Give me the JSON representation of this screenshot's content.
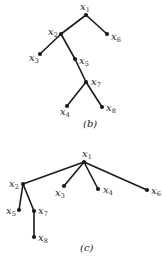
{
  "diagrams": [
    {
      "id": "b",
      "caption": "(b)",
      "caption_pos": [
        83,
        127
      ],
      "nodes": [
        {
          "id": "x1",
          "var": "x",
          "sub": "1",
          "pos": [
            86,
            15
          ],
          "label_pos": [
            80,
            10
          ]
        },
        {
          "id": "x2",
          "var": "x",
          "sub": "2",
          "pos": [
            61,
            34
          ],
          "label_pos": [
            48,
            35
          ]
        },
        {
          "id": "x3",
          "var": "x",
          "sub": "3",
          "pos": [
            40,
            54
          ],
          "label_pos": [
            29,
            61
          ]
        },
        {
          "id": "x4",
          "var": "x",
          "sub": "4",
          "pos": [
            67,
            106
          ],
          "label_pos": [
            60,
            115
          ]
        },
        {
          "id": "x5",
          "var": "x",
          "sub": "5",
          "pos": [
            75,
            59
          ],
          "label_pos": [
            79,
            64
          ]
        },
        {
          "id": "x6",
          "var": "x",
          "sub": "6",
          "pos": [
            107,
            34
          ],
          "label_pos": [
            111,
            40
          ]
        },
        {
          "id": "x7",
          "var": "x",
          "sub": "7",
          "pos": [
            86,
            82
          ],
          "label_pos": [
            91,
            85
          ]
        },
        {
          "id": "x8",
          "var": "x",
          "sub": "8",
          "pos": [
            102,
            107
          ],
          "label_pos": [
            106,
            111
          ]
        }
      ],
      "edges": [
        [
          "x1",
          "x2"
        ],
        [
          "x1",
          "x6"
        ],
        [
          "x2",
          "x3"
        ],
        [
          "x2",
          "x5"
        ],
        [
          "x5",
          "x7"
        ],
        [
          "x7",
          "x4"
        ],
        [
          "x7",
          "x8"
        ]
      ]
    },
    {
      "id": "c",
      "caption": "(c)",
      "caption_pos": [
        80,
        251
      ],
      "nodes": [
        {
          "id": "x1",
          "var": "x",
          "sub": "1",
          "pos": [
            84,
            162
          ],
          "label_pos": [
            82,
            157
          ]
        },
        {
          "id": "x2",
          "var": "x",
          "sub": "2",
          "pos": [
            23,
            184
          ],
          "label_pos": [
            9,
            187
          ]
        },
        {
          "id": "x3",
          "var": "x",
          "sub": "3",
          "pos": [
            64,
            186
          ],
          "label_pos": [
            55,
            196
          ]
        },
        {
          "id": "x4",
          "var": "x",
          "sub": "4",
          "pos": [
            98,
            189
          ],
          "label_pos": [
            103,
            193
          ]
        },
        {
          "id": "x5",
          "var": "x",
          "sub": "5",
          "pos": [
            19,
            210
          ],
          "label_pos": [
            6,
            214
          ]
        },
        {
          "id": "x6",
          "var": "x",
          "sub": "6",
          "pos": [
            147,
            190
          ],
          "label_pos": [
            151,
            194
          ]
        },
        {
          "id": "x7",
          "var": "x",
          "sub": "7",
          "pos": [
            34,
            211
          ],
          "label_pos": [
            38,
            214
          ]
        },
        {
          "id": "x8",
          "var": "x",
          "sub": "8",
          "pos": [
            34,
            237
          ],
          "label_pos": [
            38,
            241
          ]
        }
      ],
      "edges": [
        [
          "x1",
          "x2"
        ],
        [
          "x1",
          "x3"
        ],
        [
          "x1",
          "x4"
        ],
        [
          "x1",
          "x6"
        ],
        [
          "x2",
          "x5"
        ],
        [
          "x2",
          "x7"
        ],
        [
          "x7",
          "x8"
        ]
      ]
    }
  ]
}
